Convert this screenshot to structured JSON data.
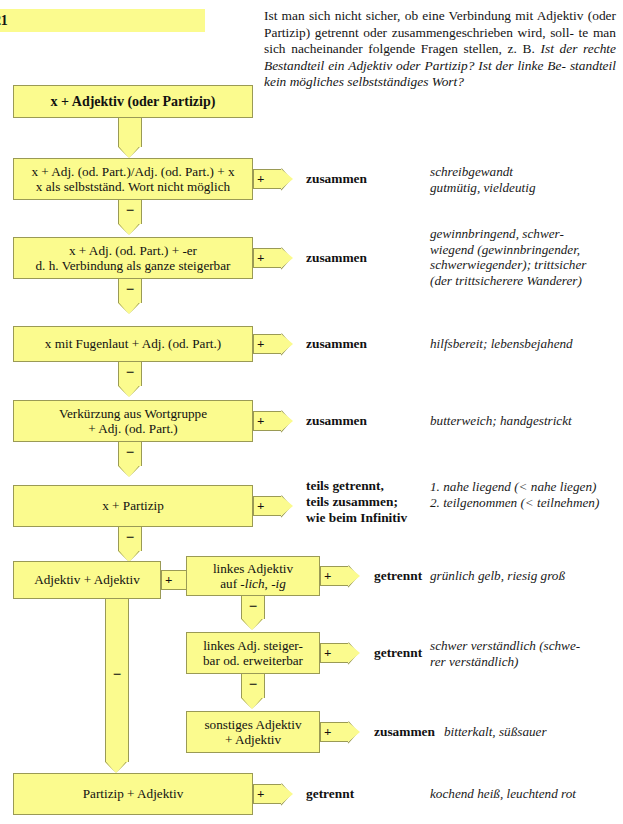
{
  "page": {
    "number": "21"
  },
  "intro": {
    "line1": "Ist man sich nicht sicher, ob eine Verbindung mit Adjektiv",
    "line2": "(oder Partizip) getrennt oder zusammengeschrieben wird, soll-",
    "line3": "te man sich nacheinander folgende Fragen stellen, z. B. ",
    "line3_italic": "Ist der",
    "line4_italic": "rechte Bestandteil ein Adjektiv oder Partizip? Ist der linke Be-",
    "line5_italic": "standteil kein mögliches selbstständiges Wort?"
  },
  "flow": {
    "start": {
      "label": "x + Adjektiv (oder Partizip)"
    },
    "nodes": [
      {
        "id": "node-1",
        "line1": "x + Adj. (od. Part.)/Adj. (od. Part.) + x",
        "line2": "x als selbstständ. Wort nicht möglich",
        "plus": "+",
        "verdict": "zusammen",
        "example_lines": [
          "schreibgewandt",
          "gutmütig, vieldeutig"
        ]
      },
      {
        "id": "node-2",
        "line1": "x + Adj. (od. Part.) + -er",
        "line2": "d. h. Verbindung als ganze steigerbar",
        "plus": "+",
        "verdict": "zusammen",
        "example_lines": [
          "gewinnbringend, schwer-",
          "wiegend (gewinnbringender,",
          "schwerwiegender); trittsicher",
          "(der trittsicherere Wanderer)"
        ]
      },
      {
        "id": "node-3",
        "line1": "x mit Fugenlaut + Adj. (od. Part.)",
        "line2": "",
        "plus": "+",
        "verdict": "zusammen",
        "example_lines": [
          "hilfsbereit; lebensbejahend"
        ]
      },
      {
        "id": "node-4",
        "line1": "Verkürzung aus Wortgruppe",
        "line2": "+ Adj. (od. Part.)",
        "plus": "+",
        "verdict": "zusammen",
        "example_lines": [
          "butterweich; handgestrickt"
        ]
      },
      {
        "id": "node-5",
        "line1": "x + Partizip",
        "line2": "",
        "plus": "+",
        "verdict_lines": [
          "teils getrennt,",
          "teils zusammen;",
          "wie beim Infinitiv"
        ],
        "example_lines": [
          "1. nahe liegend (< nahe liegen)",
          "2. teilgenommen (< teilnehmen)"
        ]
      },
      {
        "id": "node-6",
        "line1": "Adjektiv + Adjektiv",
        "line2": "",
        "plus": "+"
      },
      {
        "id": "node-7",
        "line1": "Partizip + Adjektiv",
        "line2": "",
        "plus": "+",
        "verdict": "getrennt",
        "example_lines": [
          "kochend heiß, leuchtend rot"
        ]
      }
    ],
    "branch_nodes": [
      {
        "id": "branch-1",
        "line1": "linkes Adjektiv",
        "line2_pre": "auf ",
        "line2_italic_a": "-lich",
        "line2_mid": ", ",
        "line2_italic_b": "-ig",
        "plus": "+",
        "verdict": "getrennt",
        "example_lines": [
          "grünlich gelb, riesig groß"
        ]
      },
      {
        "id": "branch-2",
        "line1": "linkes Adj. steiger-",
        "line2": "bar od. erweiterbar",
        "plus": "+",
        "verdict": "getrennt",
        "example_lines": [
          "schwer verständlich (schwe-",
          "rer verständlich)"
        ]
      },
      {
        "id": "branch-3",
        "line1": "sonstiges Adjektiv",
        "line2": "+ Adjektiv",
        "plus": "+",
        "verdict": "zusammen",
        "example_lines": [
          "bitterkalt, süßsauer"
        ]
      }
    ],
    "minus_sign": "−"
  },
  "colors": {
    "box_fill": "#fbfb8e",
    "box_border": "#9a9a55",
    "text": "#111111"
  }
}
